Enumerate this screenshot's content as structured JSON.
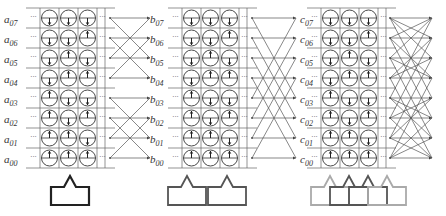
{
  "figure": {
    "panels": [
      {
        "id": "a",
        "label_prefix": "a",
        "labels": [
          "a07",
          "a06",
          "a05",
          "a04",
          "a03",
          "a02",
          "a01",
          "a00"
        ],
        "label_x": 4,
        "grid_x": 40,
        "crossing": {
          "x1": 110,
          "x2": 150,
          "strides": [
            2
          ],
          "block": 4
        },
        "shape": {
          "count": 1,
          "colors": [
            "#222222"
          ],
          "x": 51
        }
      },
      {
        "id": "b",
        "label_prefix": "b",
        "labels": [
          "b07",
          "b06",
          "b05",
          "b04",
          "b03",
          "b02",
          "b01",
          "b00"
        ],
        "label_x": 150,
        "grid_x": 182,
        "crossing": {
          "x1": 252,
          "x2": 296,
          "strides": [
            4
          ],
          "block": 8
        },
        "shape": {
          "count": 2,
          "colors": [
            "#555555",
            "#555555"
          ],
          "x": 168
        }
      },
      {
        "id": "c",
        "label_prefix": "c",
        "labels": [
          "c07",
          "c06",
          "c05",
          "c04",
          "c03",
          "c02",
          "c01",
          "c00"
        ],
        "label_x": 300,
        "grid_x": 321,
        "crossing": {
          "x1": 390,
          "x2": 432,
          "strides": [
            1,
            2,
            4
          ],
          "block": 8
        },
        "shape": {
          "count": 4,
          "colors": [
            "#aaaaaa",
            "#555555",
            "#555555",
            "#aaaaaa"
          ],
          "x": 311
        }
      }
    ],
    "rows": 8,
    "columns": 3,
    "arrows_by_row": [
      [
        "down",
        "down",
        "down"
      ],
      [
        "down",
        "down",
        "up"
      ],
      [
        "down",
        "up",
        "down"
      ],
      [
        "down",
        "up",
        "up"
      ],
      [
        "up",
        "down",
        "down"
      ],
      [
        "up",
        "down",
        "up"
      ],
      [
        "up",
        "up",
        "down"
      ],
      [
        "up",
        "up",
        "up"
      ]
    ],
    "ellipsis": "···",
    "line_color": "#555555",
    "grid_color": "#666666"
  }
}
